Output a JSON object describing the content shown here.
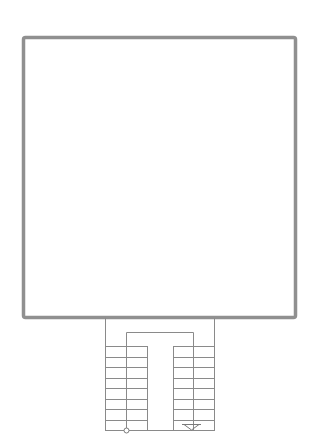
{
  "diagram": {
    "type": "architectural-floor-plan",
    "elements": {
      "room": {
        "label": "",
        "shape": "rectangle"
      },
      "staircase": {
        "label": "",
        "flights": 2,
        "left_flight_treads": 8,
        "right_flight_treads": 8,
        "landing": "top",
        "start_marker": "circle",
        "direction_marker": "down-arrow"
      }
    },
    "colors": {
      "wall": "#8f8f8f",
      "line": "#8a8a8a",
      "background": "#ffffff"
    }
  }
}
